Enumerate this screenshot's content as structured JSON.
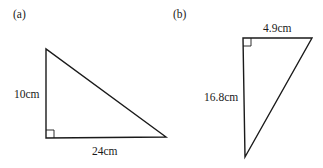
{
  "figures": [
    {
      "label": "(a)",
      "type": "right-triangle",
      "right_angle": "bottom-left",
      "sides": {
        "vertical": "10cm",
        "horizontal": "24cm"
      }
    },
    {
      "label": "(b)",
      "type": "right-triangle",
      "right_angle": "top-left",
      "sides": {
        "horizontal": "4.9cm",
        "vertical": "16.8cm"
      }
    }
  ],
  "colors": {
    "stroke": "#1a1a1a",
    "background": "#ffffff"
  }
}
